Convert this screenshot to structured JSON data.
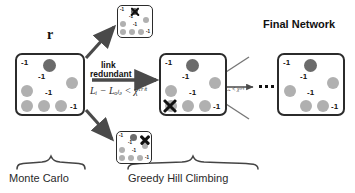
{
  "figure": {
    "title_right": "Final Network",
    "r_label": "r",
    "phase_left": "Monte Carlo",
    "phase_right": "Greedy Hill Climbing",
    "arrow_label_line1": "link",
    "arrow_label_line2": "redundant",
    "criterion_main": "Lᵢ − Lₒₗₔ < χᶜʳⁱᵗ",
    "criterion_small": "Lᵢ − Lₒₗₔ < χᶜʳⁱᵗ",
    "ellipsis": "• • •",
    "colors": {
      "box_border": "#2b2b2b",
      "node_dark": "#6b6b6b",
      "node_mid": "#9a9a9a",
      "node_light": "#b5b5b5",
      "arrow": "#4a4a4a",
      "text": "#111111"
    }
  },
  "networks": [
    {
      "id": "monte-carlo-network",
      "name": "monte-carlo-network",
      "weights": [
        "-1",
        "-1",
        "-1",
        "-1"
      ],
      "x_marks": []
    },
    {
      "id": "candidate-network-top",
      "name": "candidate-network-rejected-top",
      "weights": [
        "-1",
        "-1",
        "-1",
        "-1"
      ],
      "x_marks": [
        "top"
      ]
    },
    {
      "id": "candidate-network-bottom",
      "name": "candidate-network-rejected-bottom",
      "weights": [
        "-1",
        "-1",
        "-1",
        "-1"
      ],
      "x_marks": [
        "top-right"
      ]
    },
    {
      "id": "greedy-network",
      "name": "greedy-hill-climbing-network",
      "weights": [
        "-1",
        "-1",
        "-1",
        "-1"
      ],
      "x_marks": [
        "bottom-left"
      ]
    },
    {
      "id": "final-network",
      "name": "final-network",
      "weights": [
        "-1",
        "-1",
        "-1",
        "-1"
      ],
      "x_marks": []
    }
  ]
}
